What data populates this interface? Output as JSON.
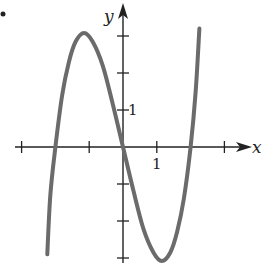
{
  "chart_data": {
    "type": "line",
    "title": "",
    "xlabel": "x",
    "ylabel": "y",
    "xlim": [
      -3,
      3
    ],
    "ylim": [
      -3,
      3
    ],
    "x_ticks": [
      -3,
      -2,
      -1,
      0,
      1,
      2,
      3
    ],
    "y_ticks": [
      -3,
      -2,
      -1,
      1,
      2,
      3
    ],
    "tick_labels": {
      "x": "1",
      "y": "1"
    },
    "grid": false,
    "legend": null,
    "series": [
      {
        "name": "f(x)",
        "color": "#6b6b6b",
        "x": [
          -2.24,
          -2.15,
          -2.0,
          -1.8,
          -1.6,
          -1.4,
          -1.15,
          -0.9,
          -0.6,
          -0.3,
          0.0,
          0.3,
          0.6,
          0.9,
          1.15,
          1.4,
          1.6,
          1.8,
          2.0,
          2.15,
          2.26
        ],
        "y": [
          -2.9,
          -1.3,
          0.0,
          1.4,
          2.3,
          2.85,
          3.08,
          2.85,
          2.2,
          1.15,
          0.0,
          -1.15,
          -2.2,
          -2.85,
          -3.08,
          -2.85,
          -2.3,
          -1.4,
          0.0,
          1.5,
          3.2
        ]
      }
    ],
    "annotations": [
      "•"
    ]
  },
  "figure": {
    "bullet": "•",
    "x_axis_label": "x",
    "y_axis_label": "y",
    "x_unit_label": "1",
    "y_unit_label": "1"
  }
}
